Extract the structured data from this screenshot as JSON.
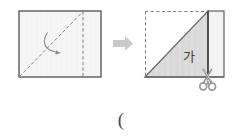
{
  "figure": {
    "colors": {
      "outline": "#6b6b6b",
      "outline_dark": "#4d4d4d",
      "fold_line": "#8a8a8a",
      "fill_light": "#f4f4f4",
      "fill_gray": "#d9d9d9",
      "fill_white": "#ffffff",
      "arrow": "#c9c9c9",
      "scissors": "#9a9a9a",
      "text": "#3d3d3d"
    },
    "left_panel": {
      "name": "unfolded-rectangle",
      "rect": {
        "x": 19,
        "y": 11,
        "width": 82,
        "height": 66
      },
      "diagonal_fold": {
        "x1": 19,
        "y1": 77,
        "x2": 83,
        "y2": 11,
        "style": "dashed"
      },
      "vertical_fold": {
        "x": 83,
        "y1": 11,
        "y2": 77,
        "style": "dashed"
      },
      "fold_arrow": {
        "name": "fold-direction-arrow",
        "label": ""
      }
    },
    "transition": {
      "name": "transition-arrow",
      "glyph": "➡",
      "x": 113,
      "y": 37,
      "width": 20,
      "height": 14
    },
    "right_panel": {
      "name": "folded-figure",
      "outer_rect": {
        "x": 145,
        "y": 11,
        "width": 79,
        "height": 66
      },
      "hidden_edges_style": "dashed",
      "diagonal": {
        "x1": 145,
        "y1": 77,
        "x2": 208,
        "y2": 11
      },
      "vertical_edge": {
        "x": 208,
        "y1": 11,
        "y2": 77,
        "style": "solid"
      },
      "region_label": "가",
      "region_label_pos": {
        "x": 189,
        "y": 57
      },
      "scissors": {
        "name": "scissors-icon",
        "glyph": "✂",
        "x": 205,
        "y": 70
      }
    },
    "caption": {
      "name": "caption-parenthesis",
      "text": "(",
      "x": 121,
      "y": 120
    }
  }
}
